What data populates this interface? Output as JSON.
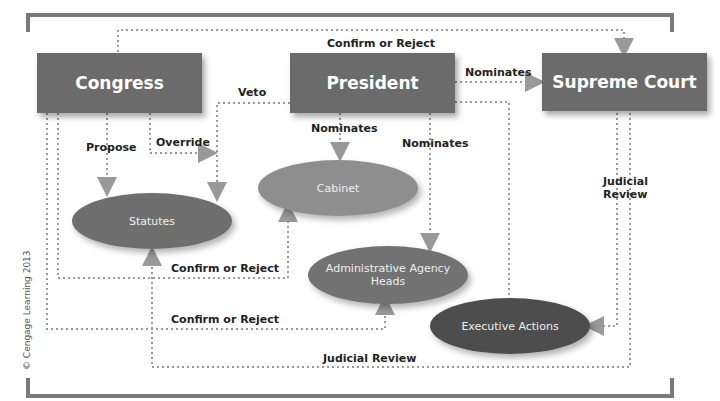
{
  "nodes": {
    "congress": "Congress",
    "president": "President",
    "supreme_court": "Supreme Court",
    "statutes": "Statutes",
    "cabinet": "Cabinet",
    "admin_heads": "Administrative Agency Heads",
    "executive_actions": "Executive Actions"
  },
  "labels": {
    "confirm_reject_top": "Confirm or Reject",
    "veto": "Veto",
    "nominates_sc": "Nominates",
    "propose": "Propose",
    "override": "Override",
    "nominates_cabinet": "Nominates",
    "nominates_admin": "Nominates",
    "judicial_review_right": "Judicial Review",
    "confirm_reject_cabinet": "Confirm or Reject",
    "confirm_reject_admin": "Confirm or Reject",
    "judicial_review_bottom": "Judicial Review"
  },
  "copyright": "© Cengage Learning 2013",
  "colors": {
    "box": "#6b6b6b",
    "cabinet": "#8e8e8e",
    "statutes": "#6e6e6e",
    "admin": "#727272",
    "executive": "#4d4d4d",
    "line": "#999999",
    "frame": "#7a7a7a"
  }
}
